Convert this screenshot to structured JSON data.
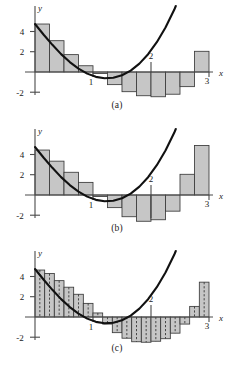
{
  "figure": {
    "title": "",
    "panels": [
      {
        "id": "a",
        "caption": "(a)",
        "method": "left-endpoint"
      },
      {
        "id": "b",
        "caption": "(b)",
        "method": "right-endpoint"
      },
      {
        "id": "c",
        "caption": "(c)",
        "method": "midpoint"
      }
    ],
    "axis_labels": {
      "x": "x",
      "y": "y"
    },
    "x_ticks": [
      "1",
      "2",
      "3"
    ],
    "y_ticks": [
      "4",
      "2",
      "-2"
    ]
  },
  "colors": {
    "bar_fill": "#c6c6c6",
    "bar_stroke": "#3a3a3a",
    "curve": "#111111",
    "axis": "#4a4a4a",
    "dashed": "#3a3a3a",
    "background": "#ffffff",
    "text": "#1a1a1a"
  },
  "chart_data": {
    "type": "bar",
    "title": "",
    "xlabel": "x",
    "ylabel": "y",
    "xlim": [
      0,
      3.35
    ],
    "ylim": [
      -3.2,
      5.6
    ],
    "grid": false,
    "legend": null,
    "x_tick_values": [
      1,
      2,
      3
    ],
    "x_tick_labels": [
      "1",
      "2",
      "3"
    ],
    "y_tick_values": [
      4,
      2,
      -2
    ],
    "y_tick_labels": [
      "4",
      "2",
      "-2"
    ],
    "curve": {
      "name": "f(x)",
      "expression": "f(x) = 4.75 - 7.2x + 0.55x^2 + 2.05x^3",
      "x": [
        0,
        0.15,
        0.3,
        0.45,
        0.6,
        0.75,
        0.9,
        1.05,
        1.2,
        1.35,
        1.5,
        1.65,
        1.8,
        1.95,
        2.1,
        2.25,
        2.4,
        2.55,
        2.7,
        2.85,
        3
      ],
      "y": [
        4.75,
        3.69,
        2.69,
        1.77,
        0.98,
        0.33,
        -0.16,
        -0.48,
        -0.62,
        -0.57,
        -0.32,
        0.14,
        0.83,
        1.76,
        2.95,
        4.41,
        6.16,
        8.22,
        10.6,
        13.32,
        16.4
      ]
    },
    "series": [
      {
        "name": "(a) Left endpoint Riemann sum, n = 12",
        "panel": "a",
        "method": "left",
        "n": 12,
        "dx": 0.25,
        "bar_left_edges": [
          0,
          0.25,
          0.5,
          0.75,
          1.0,
          1.25,
          1.5,
          1.75,
          2.0,
          2.25,
          2.5,
          2.75
        ],
        "values": [
          4.75,
          3.1,
          1.72,
          0.62,
          -0.15,
          -1.25,
          -1.95,
          -2.35,
          -2.45,
          -2.2,
          -1.45,
          2.05
        ]
      },
      {
        "name": "(b) Right endpoint Riemann sum, n = 12",
        "panel": "b",
        "method": "right",
        "n": 12,
        "dx": 0.25,
        "bar_left_edges": [
          0,
          0.25,
          0.5,
          0.75,
          1.0,
          1.25,
          1.5,
          1.75,
          2.0,
          2.25,
          2.5,
          2.75
        ],
        "values": [
          4.45,
          3.35,
          2.25,
          1.25,
          -0.15,
          -1.25,
          -2.15,
          -2.6,
          -2.45,
          -1.6,
          2.05,
          4.9
        ]
      },
      {
        "name": "(c) Midpoint Riemann sum, n = 18",
        "panel": "c",
        "method": "midpoint",
        "n": 18,
        "dx": 0.1667,
        "bar_left_edges": [
          0,
          0.1667,
          0.3333,
          0.5,
          0.6667,
          0.8333,
          1.0,
          1.1667,
          1.3333,
          1.5,
          1.6667,
          1.8333,
          2.0,
          2.1667,
          2.3333,
          2.5,
          2.6667,
          2.8333
        ],
        "values": [
          4.65,
          4.3,
          3.6,
          2.95,
          2.25,
          1.35,
          0.4,
          -0.7,
          -1.55,
          -2.1,
          -2.45,
          -2.5,
          -2.4,
          -2.15,
          -1.6,
          -0.7,
          1.05,
          3.45
        ]
      }
    ]
  }
}
